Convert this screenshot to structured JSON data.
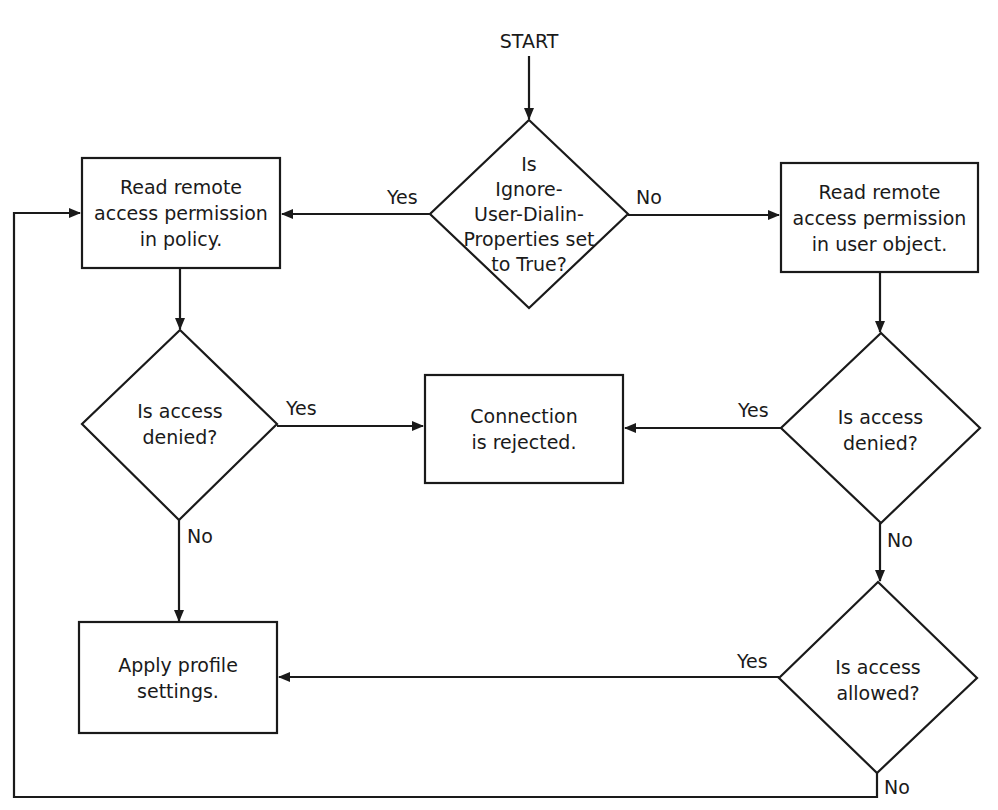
{
  "diagram": {
    "type": "flowchart",
    "colors": {
      "stroke": "#1a1a1a",
      "fill": "#ffffff",
      "text": "#1a1a1a"
    },
    "start": {
      "label": "START"
    },
    "nodes": {
      "ignore_check": {
        "shape": "diamond",
        "label": "Is\nIgnore-\nUser-Dialin-\nProperties set\nto True?"
      },
      "read_policy": {
        "shape": "rect",
        "label": "Read remote\naccess permission\nin policy."
      },
      "read_user": {
        "shape": "rect",
        "label": "Read remote\naccess permission\nin user object."
      },
      "denied_left": {
        "shape": "diamond",
        "label": "Is access\ndenied?"
      },
      "rejected": {
        "shape": "rect",
        "label": "Connection\nis rejected."
      },
      "denied_right": {
        "shape": "diamond",
        "label": "Is access\ndenied?"
      },
      "allowed": {
        "shape": "diamond",
        "label": "Is access\nallowed?"
      },
      "apply_profile": {
        "shape": "rect",
        "label": "Apply profile\nsettings."
      }
    },
    "edges": [
      {
        "from": "start",
        "to": "ignore_check",
        "label": ""
      },
      {
        "from": "ignore_check",
        "to": "read_policy",
        "label": "Yes"
      },
      {
        "from": "ignore_check",
        "to": "read_user",
        "label": "No"
      },
      {
        "from": "read_policy",
        "to": "denied_left",
        "label": ""
      },
      {
        "from": "denied_left",
        "to": "rejected",
        "label": "Yes"
      },
      {
        "from": "denied_left",
        "to": "apply_profile",
        "label": "No"
      },
      {
        "from": "read_user",
        "to": "denied_right",
        "label": ""
      },
      {
        "from": "denied_right",
        "to": "rejected",
        "label": "Yes"
      },
      {
        "from": "denied_right",
        "to": "allowed",
        "label": "No"
      },
      {
        "from": "allowed",
        "to": "apply_profile",
        "label": "Yes"
      },
      {
        "from": "allowed",
        "to": "read_policy",
        "label": "No"
      }
    ],
    "edge_labels": {
      "ignore_yes": "Yes",
      "ignore_no": "No",
      "denied_left_yes": "Yes",
      "denied_left_no": "No",
      "denied_right_yes": "Yes",
      "denied_right_no": "No",
      "allowed_yes": "Yes",
      "allowed_no": "No"
    }
  }
}
